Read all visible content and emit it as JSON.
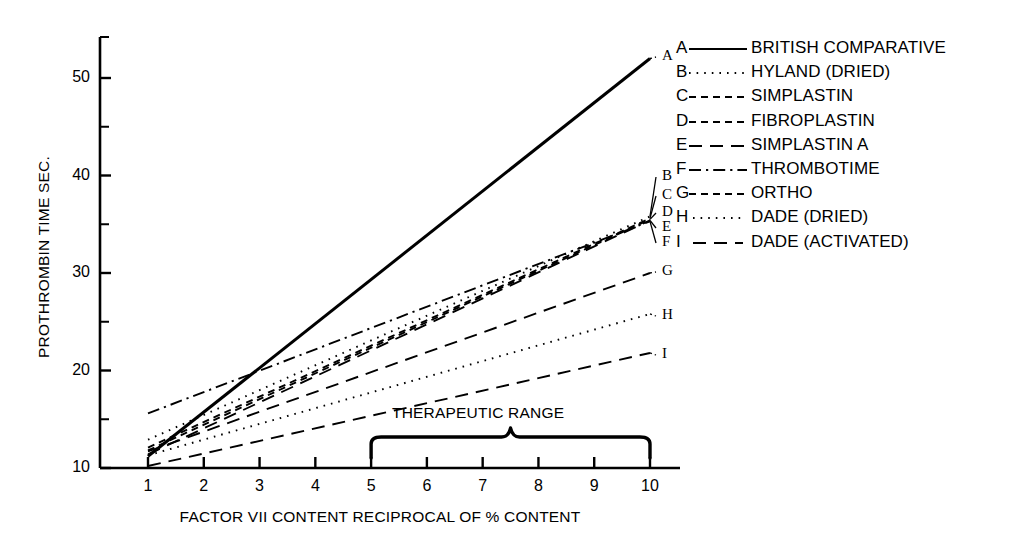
{
  "chart_data": {
    "type": "line",
    "title": "",
    "xlabel": "FACTOR VII CONTENT RECIPROCAL OF % CONTENT",
    "ylabel": "PROTHROMBIN TIME SEC.",
    "xlim": [
      1,
      10
    ],
    "ylim": [
      10,
      54
    ],
    "grid": false,
    "legend_position": "right",
    "xticks": [
      "1",
      "2",
      "3",
      "4",
      "5",
      "6",
      "7",
      "8",
      "9",
      "10"
    ],
    "xtick_values": [
      1,
      2,
      3,
      4,
      5,
      6,
      7,
      8,
      9,
      10
    ],
    "yticks": [
      "10",
      "20",
      "30",
      "40",
      "50"
    ],
    "ytick_values": [
      10,
      20,
      30,
      40,
      50
    ],
    "yminor_values": [
      15,
      25,
      35,
      45
    ],
    "annotations": [
      {
        "name": "therapeutic-range",
        "text": "THERAPEUTIC RANGE",
        "x_start": 5,
        "x_end": 10
      }
    ],
    "series": [
      {
        "key": "A",
        "name": "BRITISH COMPARATIVE",
        "style": "solid",
        "x": [
          1,
          10
        ],
        "values": [
          11.2,
          52.0
        ]
      },
      {
        "key": "B",
        "name": "HYLAND (DRIED)",
        "style": "dotted",
        "x": [
          1,
          10
        ],
        "values": [
          12.9,
          35.8
        ]
      },
      {
        "key": "C",
        "name": "SIMPLASTIN",
        "style": "dashed-short",
        "x": [
          1,
          10
        ],
        "values": [
          12.1,
          35.6
        ]
      },
      {
        "key": "D",
        "name": "FIBROPLASTIN",
        "style": "dashed-short",
        "x": [
          1,
          10
        ],
        "values": [
          11.8,
          35.5
        ]
      },
      {
        "key": "E",
        "name": "SIMPLASTIN A",
        "style": "dashed-long",
        "x": [
          1,
          10
        ],
        "values": [
          11.4,
          35.4
        ]
      },
      {
        "key": "F",
        "name": "THROMBOTIME",
        "style": "dash-dot",
        "x": [
          1,
          10
        ],
        "values": [
          15.6,
          35.3
        ]
      },
      {
        "key": "G",
        "name": "ORTHO",
        "style": "dashed-long",
        "x": [
          1,
          10
        ],
        "values": [
          11.7,
          30.0
        ]
      },
      {
        "key": "H",
        "name": "DADE (DRIED)",
        "style": "dotted",
        "x": [
          1,
          10
        ],
        "values": [
          11.3,
          25.8
        ]
      },
      {
        "key": "I",
        "name": "DADE (ACTIVATED)",
        "style": "dashed-long",
        "x": [
          1,
          10
        ],
        "values": [
          10.2,
          21.8
        ]
      }
    ],
    "end_labels": [
      "A",
      "B",
      "C",
      "D",
      "E",
      "F",
      "G",
      "H",
      "I"
    ]
  },
  "legend": {
    "rows": [
      {
        "key": "A",
        "label": "BRITISH COMPARATIVE",
        "style": "solid"
      },
      {
        "key": "B",
        "label": "HYLAND (DRIED)",
        "style": "dotted"
      },
      {
        "key": "C",
        "label": "SIMPLASTIN",
        "style": "dashed-short"
      },
      {
        "key": "D",
        "label": "FIBROPLASTIN",
        "style": "dashed-short"
      },
      {
        "key": "E",
        "label": "SIMPLASTIN A",
        "style": "dashed-long"
      },
      {
        "key": "F",
        "label": "THROMBOTIME",
        "style": "dash-dot"
      },
      {
        "key": "G",
        "label": "ORTHO",
        "style": "dashed-short"
      },
      {
        "key": "H",
        "label": "DADE (DRIED)",
        "style": "dotted"
      },
      {
        "key": "I",
        "label": "DADE (ACTIVATED)",
        "style": "dashed-long"
      }
    ]
  },
  "colors": {
    "ink": "#000000",
    "background": "#ffffff"
  }
}
